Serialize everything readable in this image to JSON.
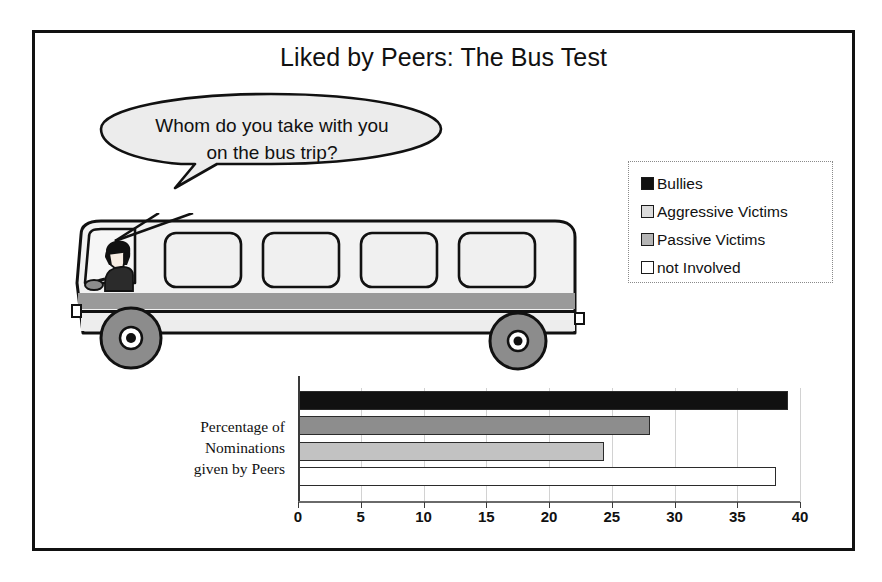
{
  "slide": {
    "title": "Liked by Peers: The Bus Test"
  },
  "speech_bubble": {
    "text": "Whom do you take with you on the bus trip?",
    "line1": "Whom do you take with you",
    "line2": "on the bus trip?"
  },
  "illustration": {
    "name": "school-bus-with-driver",
    "window_count": 4,
    "wheel_count": 2,
    "body_color": "#f0f0f0",
    "stripe_color": "#9a9a9a",
    "wheel_color": "#8c8c8c",
    "outline_color": "#111111"
  },
  "legend": {
    "position": "top-right",
    "items": [
      {
        "label": "Bullies",
        "color": "#111111",
        "swatch": "solid-black"
      },
      {
        "label": "Aggressive Victims",
        "color": "#d8d8d8",
        "swatch": "light-dotted"
      },
      {
        "label": "Passive Victims",
        "color": "#b5b5b5",
        "swatch": "medium-gray"
      },
      {
        "label": "not Involved",
        "color": "#ffffff",
        "swatch": "white-outline"
      }
    ]
  },
  "chart_data": {
    "type": "bar",
    "orientation": "horizontal",
    "title": "Liked by Peers: The Bus Test",
    "categories": [
      "Bullies",
      "Aggressive Victims",
      "Passive Victims",
      "not Involved"
    ],
    "values": [
      39,
      28,
      24.3,
      38
    ],
    "series": [
      {
        "name": "Percentage of Nominations given by Peers",
        "values": [
          39,
          28,
          24.3,
          38
        ]
      }
    ],
    "xlabel": "",
    "ylabel": "Percentage of Nominations given by Peers",
    "ylabel_lines": [
      "Percentage of",
      "Nominations",
      "given by Peers"
    ],
    "xlim": [
      0,
      40
    ],
    "ticks": [
      0,
      5,
      10,
      15,
      20,
      25,
      30,
      35,
      40
    ],
    "tick_labels": [
      "0",
      "5",
      "10",
      "15",
      "20",
      "25",
      "30",
      "35",
      "40"
    ],
    "grid": true,
    "legend_position": "top-right",
    "bar_colors": [
      "#111111",
      "#8d8d8d",
      "#c2c2c2",
      "#ffffff"
    ]
  }
}
